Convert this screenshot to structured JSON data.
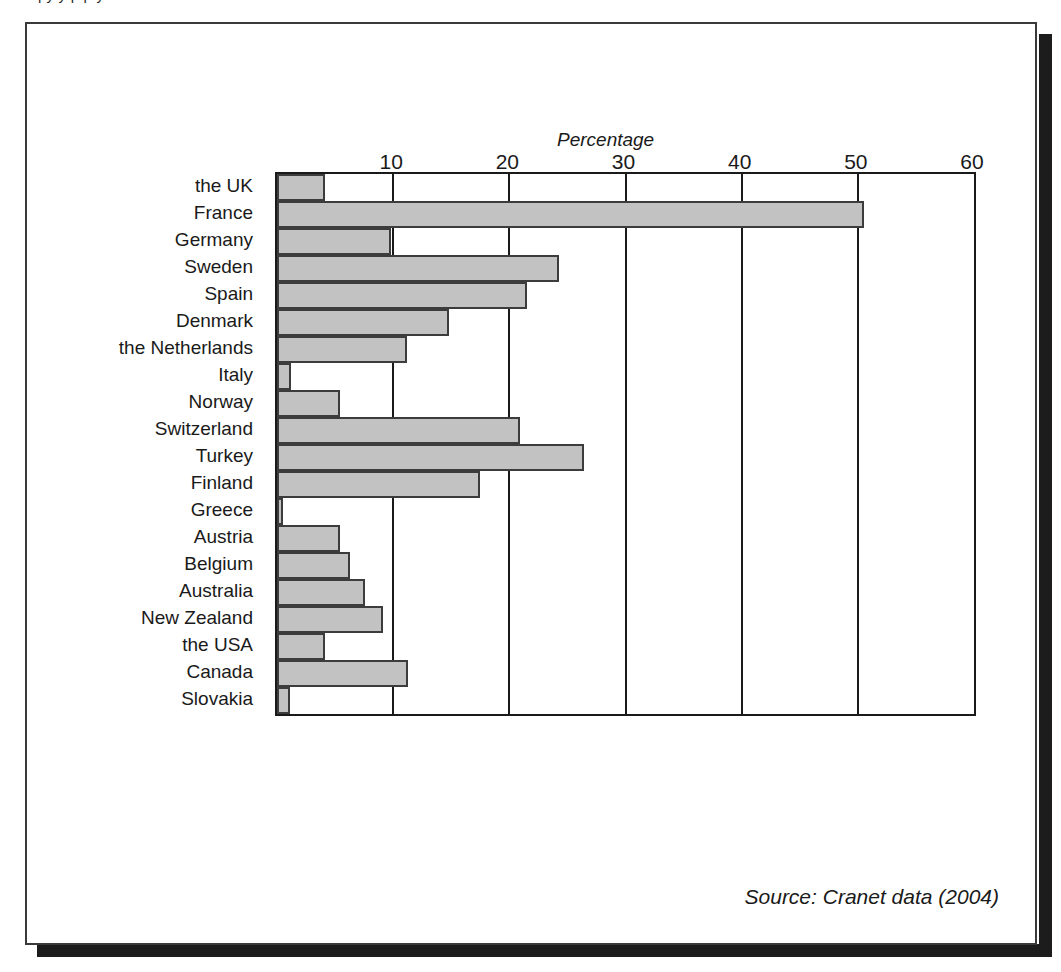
{
  "figure": {
    "top_caption": "py     y        p                     p y",
    "source_note": "Source: Cranet data (2004)",
    "frame_color": "#3a3a3a",
    "shadow_color": "#1c1c1c",
    "bar_fill_color": "#c2c2c2",
    "bar_border_color": "#3c3c3c",
    "axis_color": "#1a1a1a"
  },
  "chart_data": {
    "type": "bar",
    "orientation": "horizontal",
    "title": "",
    "xlabel": "Percentage",
    "ylabel": "",
    "xlim": [
      0,
      60
    ],
    "ylim": null,
    "grid": true,
    "legend": null,
    "xticks": [
      10,
      20,
      30,
      40,
      50,
      60
    ],
    "xtick_labels": [
      "10",
      "20",
      "30",
      "40",
      "50",
      "60"
    ],
    "categories": [
      "the UK",
      "France",
      "Germany",
      "Sweden",
      "Spain",
      "Denmark",
      "the Netherlands",
      "Italy",
      "Norway",
      "Switzerland",
      "Turkey",
      "Finland",
      "Greece",
      "Austria",
      "Belgium",
      "Australia",
      "New Zealand",
      "the USA",
      "Canada",
      "Slovakia"
    ],
    "values": [
      4.1,
      50.5,
      9.8,
      24.3,
      21.5,
      14.8,
      11.2,
      1.2,
      5.4,
      20.9,
      26.4,
      17.5,
      0.4,
      5.4,
      6.3,
      7.6,
      9.1,
      4.1,
      11.3,
      1.1
    ],
    "annotations": [
      "Source: Cranet data (2004)"
    ]
  }
}
